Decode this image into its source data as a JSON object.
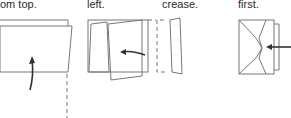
{
  "captions": [
    {
      "id": "step1",
      "text": "om top."
    },
    {
      "id": "step2",
      "text": "left."
    },
    {
      "id": "step3",
      "text": "crease."
    },
    {
      "id": "step4",
      "text": "first."
    }
  ],
  "colors": {
    "line": "#777777",
    "arrow": "#333333",
    "text": "#2a2a2a"
  }
}
